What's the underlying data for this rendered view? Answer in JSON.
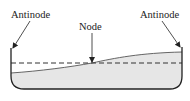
{
  "diagram": {
    "labels": {
      "left_antinode": "Antinode",
      "node": "Node",
      "right_antinode": "Antinode"
    },
    "colors": {
      "water_fill": "#e6e6e6",
      "outline": "#222222",
      "dashed_line": "#333333",
      "text": "#222222"
    }
  }
}
